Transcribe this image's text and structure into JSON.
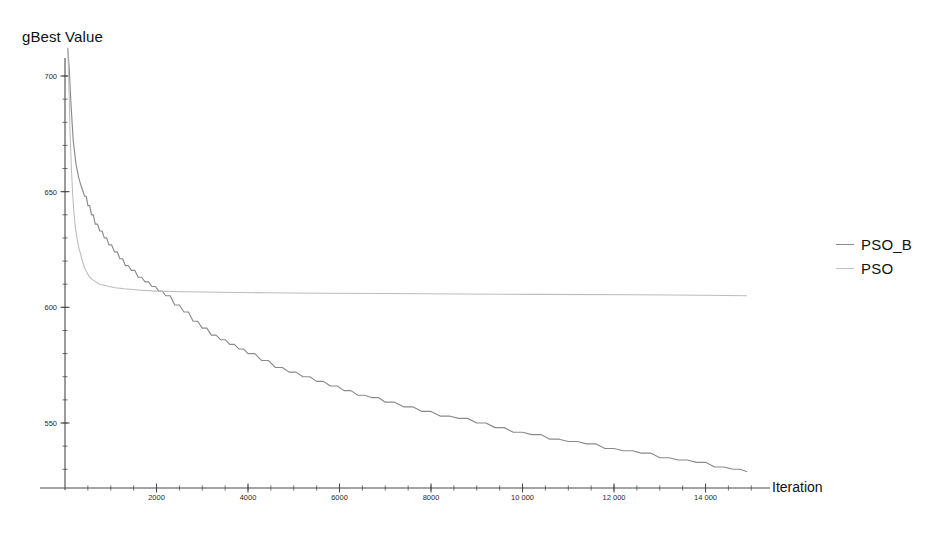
{
  "chart_data": {
    "type": "line",
    "title": "",
    "xlabel": "Iteration",
    "ylabel": "gBest Value",
    "xlim": [
      0,
      15300
    ],
    "ylim": [
      523,
      712
    ],
    "grid": false,
    "legend_position": "right",
    "x_tick_labels": [
      "2000",
      "4000",
      "6000",
      "8000",
      "10 000",
      "12 000",
      "14 000"
    ],
    "x_tick_values": [
      2000,
      4000,
      6000,
      8000,
      10000,
      12000,
      14000
    ],
    "y_tick_labels": [
      "700",
      "650",
      "600",
      "550"
    ],
    "y_tick_values": [
      700,
      650,
      600,
      550
    ],
    "y_minor_step": 10,
    "x_minor_step": 500,
    "series": [
      {
        "name": "PSO_B",
        "color": "#8a8a8a",
        "x": [
          60,
          90,
          130,
          180,
          240,
          300,
          360,
          430,
          500,
          580,
          660,
          760,
          860,
          960,
          1080,
          1200,
          1320,
          1450,
          1600,
          1750,
          1900,
          2050,
          2200,
          2400,
          2600,
          2800,
          3000,
          3200,
          3400,
          3600,
          3800,
          4000,
          4300,
          4600,
          4900,
          5200,
          5500,
          5800,
          6100,
          6400,
          6700,
          7000,
          7400,
          7800,
          8200,
          8600,
          9000,
          9400,
          9800,
          10200,
          10600,
          11000,
          11400,
          11800,
          12200,
          12600,
          13000,
          13400,
          13800,
          14200,
          14600,
          14900
        ],
        "y": [
          712,
          704,
          688,
          672,
          662,
          656,
          652,
          648,
          644,
          640,
          636,
          633,
          630,
          627,
          624,
          621,
          618,
          616,
          613,
          611,
          609,
          607,
          605,
          601,
          598,
          594,
          591,
          588,
          586,
          584,
          582,
          580,
          577,
          574,
          572,
          570,
          568,
          566,
          564,
          562,
          561,
          559,
          557,
          555,
          553,
          552,
          550,
          548,
          546,
          545,
          543,
          542,
          541,
          539,
          538,
          537,
          535,
          534,
          533,
          531,
          530,
          529
        ]
      },
      {
        "name": "PSO",
        "color": "#bcbcbc",
        "x": [
          60,
          80,
          110,
          140,
          170,
          200,
          230,
          260,
          300,
          340,
          380,
          430,
          480,
          540,
          600,
          680,
          760,
          860,
          960,
          1100,
          1300,
          1600,
          2000,
          2600,
          3400,
          4400,
          5600,
          7000,
          8600,
          10400,
          12400,
          14000,
          14900
        ],
        "y": [
          712,
          700,
          676,
          660,
          648,
          640,
          634,
          630,
          626,
          623,
          620,
          617,
          615,
          613,
          612,
          611,
          610,
          609.5,
          609,
          608.5,
          608,
          607.5,
          607,
          606.7,
          606.5,
          606.3,
          606.1,
          606,
          605.8,
          605.6,
          605.4,
          605.2,
          605
        ]
      }
    ]
  },
  "axis": {
    "y_title": "gBest Value",
    "x_title": "Iteration",
    "axis_color": "#4a4a4a"
  },
  "legend": {
    "entries": [
      {
        "label": "PSO_B",
        "color": "#8a8a8a"
      },
      {
        "label": "PSO",
        "color": "#c2c2c2"
      }
    ]
  }
}
